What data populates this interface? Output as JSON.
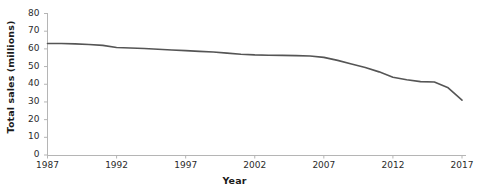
{
  "chart_data": {
    "type": "line",
    "title": "",
    "xlabel": "Year",
    "ylabel": "Total sales (millions)",
    "xlim": [
      1987,
      2017
    ],
    "ylim": [
      0,
      80
    ],
    "grid": false,
    "legend": "none",
    "line_color": "#555555",
    "axis_color": "#b0b0b0",
    "yticks": [
      80,
      70,
      60,
      50,
      40,
      30,
      20,
      10,
      0
    ],
    "xticks": [
      1987,
      1992,
      1997,
      2002,
      2007,
      2012,
      2017
    ],
    "series": [
      {
        "name": "Total sales",
        "x": [
          1987,
          1988,
          1989,
          1990,
          1991,
          1992,
          1993,
          1994,
          1995,
          1996,
          1997,
          1998,
          1999,
          2000,
          2001,
          2002,
          2003,
          2004,
          2005,
          2006,
          2007,
          2008,
          2009,
          2010,
          2011,
          2012,
          2013,
          2014,
          2015,
          2016,
          2017
        ],
        "values": [
          63.0,
          63.0,
          62.8,
          62.5,
          62.0,
          60.8,
          60.5,
          60.2,
          59.8,
          59.4,
          59.0,
          58.6,
          58.2,
          57.6,
          57.0,
          56.6,
          56.4,
          56.3,
          56.2,
          56.0,
          55.2,
          53.5,
          51.5,
          49.5,
          47.0,
          44.0,
          42.5,
          41.5,
          41.3,
          38.0,
          31.0
        ]
      }
    ]
  },
  "axes": {
    "ylabel_text": "Total sales (millions)",
    "xlabel_text": "Year"
  }
}
